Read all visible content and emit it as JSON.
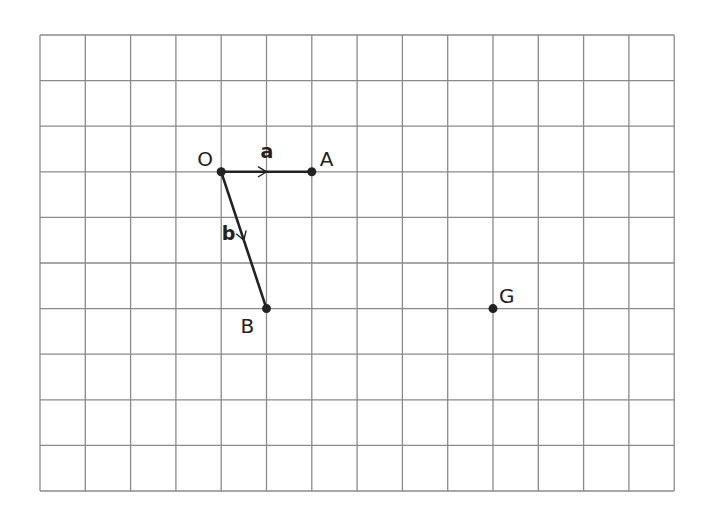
{
  "grid": {
    "cols": 14,
    "rows": 10,
    "origin_x": 40,
    "origin_y": 35,
    "cell_w": 45.3,
    "cell_h": 45.6,
    "line_color": "#8a8a8a"
  },
  "points": [
    {
      "label": "O",
      "gx": 4,
      "gy": 3,
      "label_dx": -24,
      "label_dy": -6
    },
    {
      "label": "A",
      "gx": 6,
      "gy": 3,
      "label_dx": 8,
      "label_dy": -6
    },
    {
      "label": "B",
      "gx": 5,
      "gy": 6,
      "label_dx": -26,
      "label_dy": 24
    },
    {
      "label": "G",
      "gx": 10,
      "gy": 6,
      "label_dx": 6,
      "label_dy": -6
    }
  ],
  "vectors": [
    {
      "name": "a",
      "from": "O",
      "to": "A",
      "label_dx": -6,
      "label_dy": -14
    },
    {
      "name": "b",
      "from": "O",
      "to": "B",
      "label_dx": -22,
      "label_dy": 0
    }
  ],
  "colors": {
    "ink": "#222222"
  }
}
